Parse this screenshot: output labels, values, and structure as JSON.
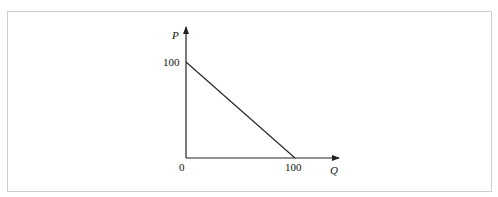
{
  "diagram": {
    "type": "linear demand curve",
    "axes": {
      "y_label": "P",
      "x_label": "Q",
      "origin_label": "0"
    },
    "ticks": {
      "y_intercept": "100",
      "x_intercept": "100"
    },
    "line": {
      "from": {
        "Q": 0,
        "P": 100
      },
      "to": {
        "Q": 100,
        "P": 0
      }
    },
    "colors": {
      "line": "#222222",
      "frame": "#cfcfcf"
    }
  }
}
